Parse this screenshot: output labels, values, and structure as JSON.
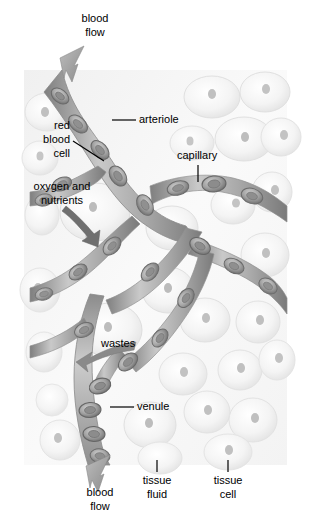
{
  "figure": {
    "panel": {
      "x": 24,
      "y": 70,
      "width": 263,
      "height": 395,
      "background": "#fdfdfd",
      "tint": "#efefef"
    },
    "colors": {
      "vessel_dark": "#8f8f8f",
      "vessel_mid": "#b4b4b4",
      "vessel_light": "#d8d8d8",
      "rbc_outline": "#6e6e6e",
      "rbc_fill": "#a9a9a9",
      "tissue_cell": "#f2f2f2",
      "tissue_outline": "#dcdcdc",
      "nucleus": "#b0b0b0",
      "arrow_gray": "#9a9a9a",
      "leader": "#000000",
      "text": "#000000"
    }
  },
  "labels": {
    "blood_flow_top": {
      "line1": "blood",
      "line2": "flow",
      "x": 95,
      "y": 22
    },
    "red_blood_cell": {
      "line1": "red",
      "line2": "blood",
      "line3": "cell",
      "x": 70,
      "y": 129
    },
    "oxygen_nutrients": {
      "line1": "oxygen and",
      "line2": "nutrients",
      "x": 62,
      "y": 190
    },
    "arteriole": {
      "text": "arteriole",
      "x": 139,
      "y": 123
    },
    "capillary": {
      "text": "capillary",
      "x": 177,
      "y": 159
    },
    "wastes": {
      "text": "wastes",
      "x": 101,
      "y": 347
    },
    "venule": {
      "text": "venule",
      "x": 137,
      "y": 410
    },
    "blood_flow_bottom": {
      "line1": "blood",
      "line2": "flow",
      "x": 100,
      "y": 496
    },
    "tissue_fluid": {
      "line1": "tissue",
      "line2": "fluid",
      "x": 157,
      "y": 484
    },
    "tissue_cell": {
      "line1": "tissue",
      "line2": "cell",
      "x": 228,
      "y": 484
    }
  },
  "icons": {
    "flow_arrow_top": "down-left-arrow-icon",
    "flow_arrow_bottom": "down-left-arrow-icon",
    "oxygen_arrow": "diffusion-arrow-icon",
    "wastes_arrow": "diffusion-arrow-icon"
  }
}
